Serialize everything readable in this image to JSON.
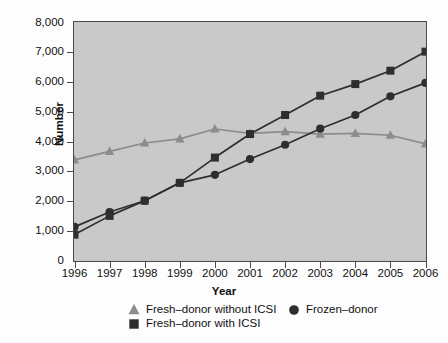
{
  "chart_data": {
    "type": "line",
    "title": "",
    "xlabel": "Year",
    "ylabel": "Number",
    "categories": [
      "1996",
      "1997",
      "1998",
      "1999",
      "2000",
      "2001",
      "2002",
      "2003",
      "2004",
      "2005",
      "2006"
    ],
    "xlim": [
      1996,
      2006
    ],
    "ylim": [
      0,
      8000
    ],
    "ytick_values": [
      0,
      1000,
      2000,
      3000,
      4000,
      5000,
      6000,
      7000,
      8000
    ],
    "ytick_labels": [
      "0",
      "1,000",
      "2,000",
      "3,000",
      "4,000",
      "5,000",
      "6,000",
      "7,000",
      "8,000"
    ],
    "grid": false,
    "legend_position": "bottom",
    "plot_background": "#c9c9c9",
    "series": [
      {
        "name": "Fresh–donor without ICSI",
        "marker": "triangle",
        "color": "#8c8c8c",
        "values": [
          3380,
          3670,
          3950,
          4090,
          4420,
          4270,
          4330,
          4250,
          4270,
          4210,
          3920
        ]
      },
      {
        "name": "Fresh–donor with ICSI",
        "marker": "square",
        "color": "#2e2e2e",
        "values": [
          870,
          1500,
          2010,
          2610,
          3460,
          4250,
          4890,
          5540,
          5930,
          6380,
          7020
        ]
      },
      {
        "name": "Frozen–donor",
        "marker": "circle",
        "color": "#2e2e2e",
        "values": [
          1130,
          1630,
          2010,
          2610,
          2880,
          3410,
          3890,
          4430,
          4890,
          5520,
          5970
        ]
      }
    ]
  },
  "legend": {
    "items": [
      {
        "label": "Fresh–donor without ICSI",
        "marker": "triangle",
        "color": "#8c8c8c"
      },
      {
        "label": "Fresh–donor with ICSI",
        "marker": "square",
        "color": "#2e2e2e"
      },
      {
        "label": "Frozen–donor",
        "marker": "circle",
        "color": "#2e2e2e"
      }
    ]
  },
  "caption": ""
}
